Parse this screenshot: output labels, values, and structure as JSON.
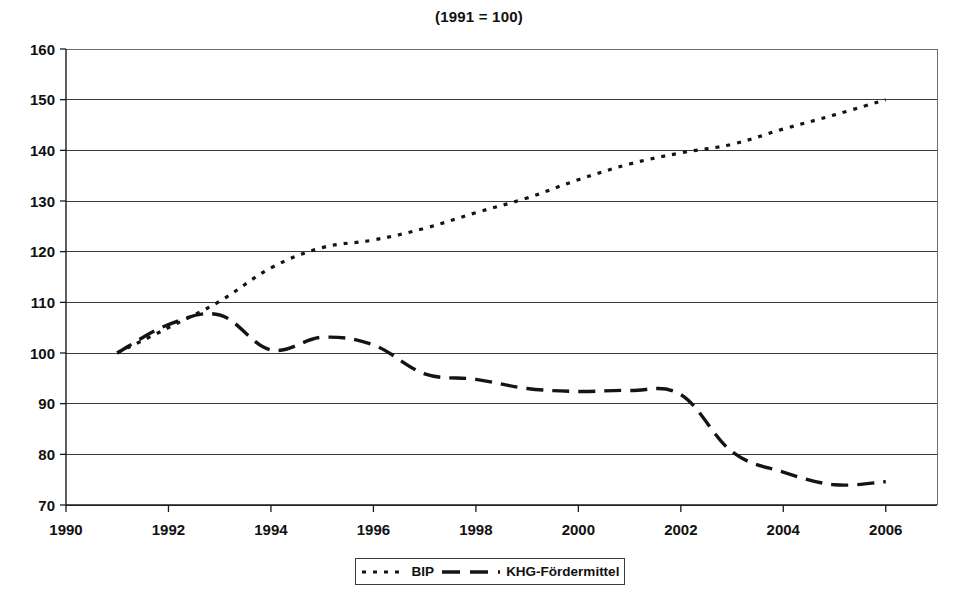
{
  "chart_data": {
    "type": "line",
    "title": "(1991 = 100)",
    "subtitle": "",
    "xlabel": "",
    "ylabel": "",
    "xlim": [
      1990,
      2007
    ],
    "ylim": [
      70,
      160
    ],
    "x_ticks": [
      1990,
      1992,
      1994,
      1996,
      1998,
      2000,
      2002,
      2004,
      2006
    ],
    "y_ticks": [
      70,
      80,
      90,
      100,
      110,
      120,
      130,
      140,
      150,
      160
    ],
    "grid": "horizontal",
    "legend_position": "bottom-center",
    "series": [
      {
        "name": "BIP",
        "style": "dotted",
        "color": "#141414",
        "x": [
          1991,
          1992,
          1993,
          1994,
          1995,
          1996,
          1997,
          1998,
          1999,
          2000,
          2001,
          2002,
          2003,
          2004,
          2005,
          2006
        ],
        "values": [
          100.0,
          105.0,
          110.2,
          116.8,
          120.8,
          122.3,
          124.6,
          127.7,
          130.6,
          134.2,
          137.3,
          139.5,
          141.2,
          144.2,
          147.0,
          150.0
        ]
      },
      {
        "name": "KHG-Fördermittel",
        "style": "dashed",
        "color": "#141414",
        "x": [
          1991,
          1992,
          1993,
          1994,
          1995,
          1996,
          1997,
          1998,
          1999,
          2000,
          2001,
          2002,
          2003,
          2004,
          2005,
          2006
        ],
        "values": [
          100.0,
          105.6,
          107.5,
          100.6,
          103.1,
          101.6,
          95.9,
          94.8,
          93.0,
          92.4,
          92.6,
          91.8,
          80.5,
          76.5,
          74.0,
          74.6
        ]
      }
    ]
  },
  "title": {
    "text": "(1991 = 100)"
  },
  "legend": {
    "items": [
      {
        "label": "BIP",
        "style": "dotted"
      },
      {
        "label": "KHG-Fördermittel",
        "style": "dashed"
      }
    ]
  },
  "axes": {
    "y_labels": [
      "160",
      "150",
      "140",
      "130",
      "120",
      "110",
      "100",
      "90",
      "80",
      "70"
    ],
    "x_labels": [
      "1990",
      "1992",
      "1994",
      "1996",
      "1998",
      "2000",
      "2002",
      "2004",
      "2006"
    ]
  },
  "colors": {
    "line": "#141414",
    "grid": "#3a3a3a",
    "frame": "#6e6e6e",
    "axis": "#1a1a1a",
    "background": "#ffffff"
  }
}
